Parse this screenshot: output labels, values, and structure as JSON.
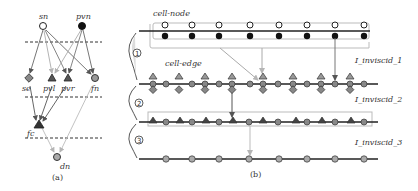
{
  "panel_a": {
    "caption": "(a)",
    "nodes": [
      {
        "id": "sn",
        "label": "sn",
        "shape": "circle-open"
      },
      {
        "id": "pvn",
        "label": "pvn",
        "shape": "circle-black"
      },
      {
        "id": "se",
        "label": "se",
        "shape": "diamond-gray"
      },
      {
        "id": "pvl",
        "label": "pvl",
        "shape": "triangle-dark"
      },
      {
        "id": "pvr",
        "label": "pvr",
        "shape": "triangle-dark"
      },
      {
        "id": "fn",
        "label": "fn",
        "shape": "circle-gray"
      },
      {
        "id": "fc",
        "label": "fc",
        "shape": "triangle-dark"
      },
      {
        "id": "dn",
        "label": "dn",
        "shape": "circle-gray"
      }
    ]
  },
  "panel_b": {
    "caption": "(b)",
    "label_cell_node": "cell-node",
    "label_cell_edge": "cell-edge",
    "levels": [
      {
        "marker": "1",
        "name": "I_inviscid_1"
      },
      {
        "marker": "2",
        "name": "I_inviscid_2"
      },
      {
        "marker": "3",
        "name": "I_inviscid_3"
      }
    ]
  },
  "colors": {
    "line": "#222222",
    "gray_arrow": "#b5b5b5",
    "dark_arrow": "#555555",
    "node_gray": "#9a9a9a",
    "node_dark": "#444444",
    "box": "#bdbdbd"
  }
}
